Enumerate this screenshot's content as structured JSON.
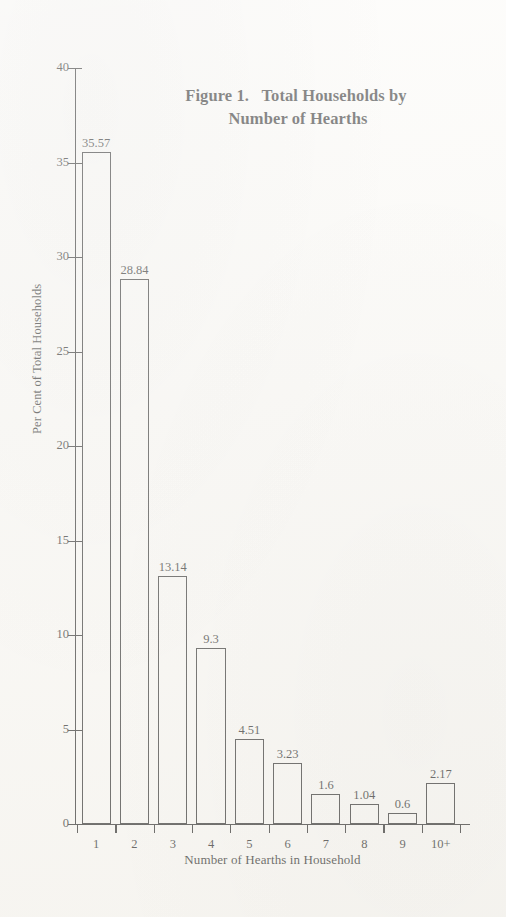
{
  "figure": {
    "title_line_1": "Figure 1.   Total Households by",
    "title_line_2": "Number of Hearths"
  },
  "chart_data": {
    "type": "bar",
    "title": "Figure 1. Total Households by Number of Hearths",
    "xlabel": "Number of Hearths in Household",
    "ylabel": "Per Cent of Total Households",
    "categories": [
      "1",
      "2",
      "3",
      "4",
      "5",
      "6",
      "7",
      "8",
      "9",
      "10+"
    ],
    "values": [
      35.57,
      28.84,
      13.14,
      9.3,
      4.51,
      3.23,
      1.6,
      1.04,
      0.6,
      2.17
    ],
    "value_labels": [
      "35.57",
      "28.84",
      "13.14",
      "9.3",
      "4.51",
      "3.23",
      "1.6",
      "1.04",
      "0.6",
      "2.17"
    ],
    "ylim": [
      0,
      40
    ],
    "yticks": [
      0,
      5,
      10,
      15,
      20,
      25,
      30,
      35,
      40
    ],
    "ytick_labels": [
      "0",
      "5",
      "10",
      "15",
      "20",
      "25",
      "30",
      "35",
      "40"
    ],
    "grid": false,
    "legend": null,
    "bar_style": "unfilled-outline",
    "bar_edge_color": "#232323",
    "bar_fill_color": "transparent",
    "background_color": "#fbfaf7"
  }
}
